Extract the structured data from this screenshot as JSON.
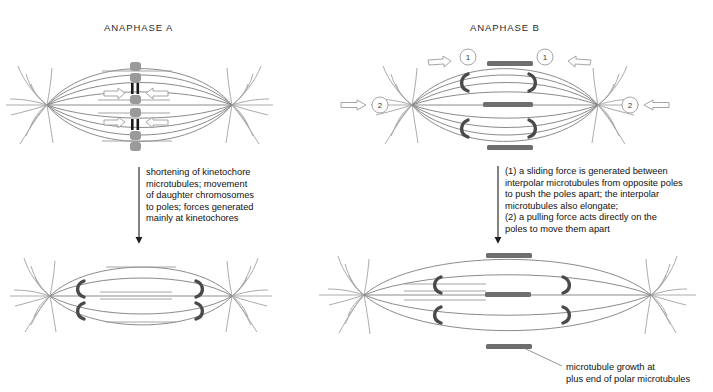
{
  "figure": {
    "type": "diagram",
    "background_color": "#ffffff"
  },
  "panels": {
    "left": {
      "title": "ANAPHASE A",
      "caption": "shortening of kinetochore\nmicrotubules; movement\nof daughter chromosomes\nto poles; forces generated\nmainly at kinetochores"
    },
    "right": {
      "title": "ANAPHASE B",
      "caption": "(1) a sliding force is generated between\ninterpolar microtubules from opposite poles\nto push the poles apart; the interpolar\nmicrotubules also elongate;\n(2) a pulling force acts directly on the\npoles to move them apart"
    }
  },
  "annotations": {
    "growth_label": "microtubule growth at\nplus end of polar microtubules",
    "marker_one": "1",
    "marker_two": "2"
  },
  "colors": {
    "microtubule": "#8b8b8b",
    "overlap_bar": "#6e6e6e",
    "kinetochore_hook": "#4a4a4a",
    "chromosome": "#9a9a9a",
    "centromere": "#1c1c1c",
    "arrow_outline": "#9c9c9c",
    "flow_arrow": "#1d1d1d",
    "text": "#111111"
  }
}
